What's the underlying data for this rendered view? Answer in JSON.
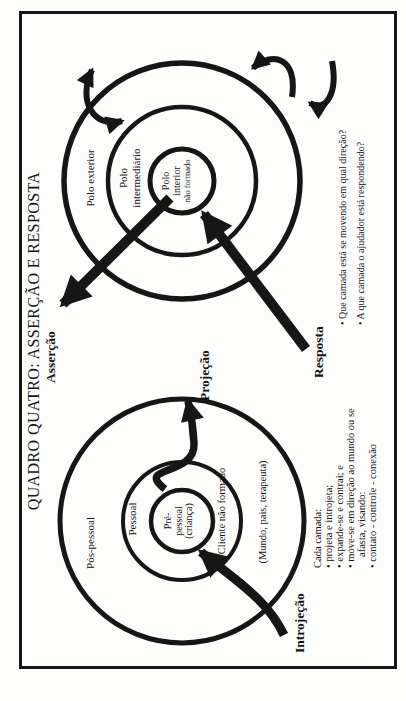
{
  "title": "QUADRO QUATRO: ASSERÇÃO E RESPOSTA",
  "left_diagram": {
    "outer_label": "Pós-pessoal",
    "middle_label": "Pessoal",
    "inner_lines": [
      "Pré-",
      "pessoal",
      "(criança)"
    ],
    "note_middle": "Cliente não formado",
    "note_outer": "(Mundo, pais, terapeuta)",
    "arrow_out_label": "Projeção",
    "arrow_in_label": "Introjeção"
  },
  "right_diagram": {
    "outer_label": "Polo exterior",
    "middle_lines": [
      "Polo",
      "intermediário"
    ],
    "inner_lines": [
      "Polo",
      "interior",
      "não formado"
    ],
    "arrow_out_label": "Asserção",
    "arrow_in_label": "Resposta"
  },
  "notes": {
    "heading": "Cada camada:",
    "lines": [
      "• projeta e introjeta;",
      "• expande-se e contrai; e",
      "• move-se em direção ao mundo ou se",
      "afasta, visando:",
      "• contato - controle - conexão"
    ]
  },
  "questions": [
    "• Que camada está se movendo em qual direção?",
    "• A que camada o ajudador está respondendo?"
  ],
  "colors": {
    "ink": "#161616",
    "paper": "#fdfdfc"
  }
}
